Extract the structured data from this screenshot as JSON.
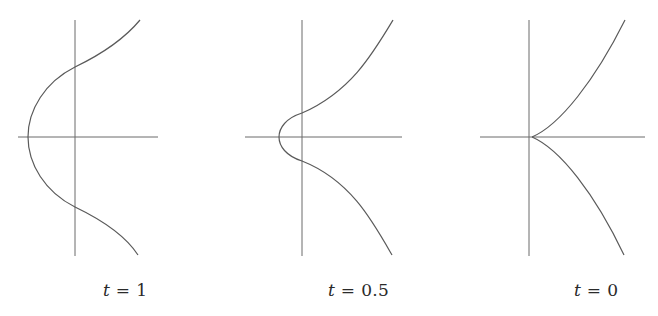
{
  "figure": {
    "stroke_color": "#5a5a5a",
    "axis_color": "#6a6a6a",
    "panels": [
      {
        "id": "t1",
        "variable": "t",
        "equals": "=",
        "value": "1",
        "label": "t = 1",
        "feature": "smooth curve, wide loop-free bulge crossing negative x-axis"
      },
      {
        "id": "t05",
        "variable": "t",
        "equals": "=",
        "value": "0.5",
        "label": "t = 0.5",
        "feature": "smooth curve, narrower bulge near origin"
      },
      {
        "id": "t0",
        "variable": "t",
        "equals": "=",
        "value": "0",
        "label": "t = 0",
        "feature": "cusp at origin"
      }
    ]
  }
}
